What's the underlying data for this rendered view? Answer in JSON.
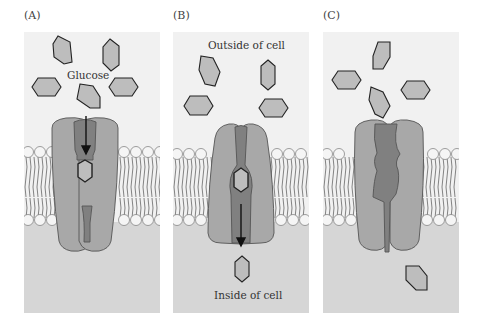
{
  "figure": {
    "panels": [
      {
        "label": "(A)",
        "annotation": "Glucose",
        "state": "outward-open, glucose entering binding site"
      },
      {
        "label": "(B)",
        "annotation_top": "Outside of cell",
        "annotation_bottom": "Inside of cell",
        "state": "inward-open, glucose released to cytoplasm"
      },
      {
        "label": "(C)",
        "state": "transporter returns to outward-open conformation, glucose inside cell"
      }
    ]
  },
  "colors": {
    "background": "#ffffff",
    "extracellular": "#f1f1f1",
    "cytoplasm": "#d6d6d6",
    "transporter": "#a8a8a8",
    "channel": "#808080",
    "glucose_fill": "#bdbdbd",
    "glucose_stroke": "#222222",
    "lipid_head": "#f5f5f5"
  }
}
